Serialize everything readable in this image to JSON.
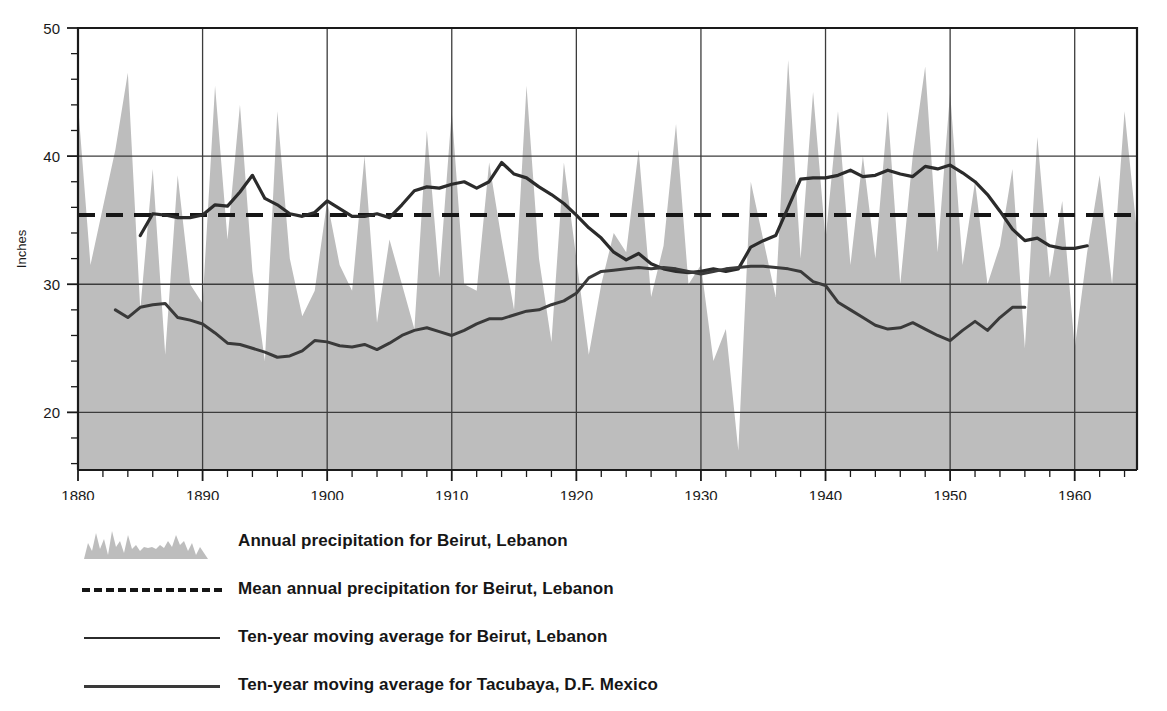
{
  "chart_data": {
    "type": "area",
    "title": "",
    "xlabel": "",
    "ylabel": "Inches",
    "xlim": [
      1880,
      1965
    ],
    "ylim": [
      15.5,
      50
    ],
    "xticks": [
      1880,
      1890,
      1900,
      1910,
      1920,
      1930,
      1940,
      1950,
      1960
    ],
    "xtick_labels": [
      "1880",
      "1890",
      "1900",
      "1910",
      "1920",
      "1930",
      "1940",
      "1950",
      "1960"
    ],
    "yticks": [
      20,
      30,
      40,
      50
    ],
    "ytick_labels": [
      "20",
      "30",
      "40",
      "50"
    ],
    "minor_tick_interval_x": 2,
    "minor_tick_interval_y": 2,
    "grid": "major gridlines at y=20,30,40 and x=1890,1900,1910,1920,1930,1940,1950,1960",
    "legend_position": "below plot, left aligned",
    "mean_value": 35.4,
    "series": [
      {
        "name": "Annual precipitation for Beirut, Lebanon",
        "render": "area",
        "color": "#bdbdbd",
        "x": [
          1880,
          1881,
          1882,
          1883,
          1884,
          1885,
          1886,
          1887,
          1888,
          1889,
          1890,
          1891,
          1892,
          1893,
          1894,
          1895,
          1896,
          1897,
          1898,
          1899,
          1900,
          1901,
          1902,
          1903,
          1904,
          1905,
          1906,
          1907,
          1908,
          1909,
          1910,
          1911,
          1912,
          1913,
          1914,
          1915,
          1916,
          1917,
          1918,
          1919,
          1920,
          1921,
          1922,
          1923,
          1924,
          1925,
          1926,
          1927,
          1928,
          1929,
          1930,
          1931,
          1932,
          1933,
          1934,
          1935,
          1936,
          1937,
          1938,
          1939,
          1940,
          1941,
          1942,
          1943,
          1944,
          1945,
          1946,
          1947,
          1948,
          1949,
          1950,
          1951,
          1952,
          1953,
          1954,
          1955,
          1956,
          1957,
          1958,
          1959,
          1960,
          1961,
          1962,
          1963,
          1964,
          1965
        ],
        "values": [
          44.0,
          31.5,
          36.0,
          40.5,
          46.5,
          28.0,
          39.0,
          24.5,
          38.5,
          30.0,
          28.5,
          45.5,
          33.5,
          44.0,
          31.0,
          24.0,
          43.5,
          32.0,
          27.5,
          29.5,
          36.5,
          31.5,
          29.5,
          40.0,
          27.0,
          33.5,
          30.0,
          26.5,
          42.0,
          30.5,
          43.5,
          30.0,
          29.5,
          39.5,
          33.5,
          28.0,
          45.5,
          32.0,
          25.5,
          39.5,
          32.0,
          24.5,
          30.0,
          34.0,
          32.5,
          40.5,
          29.0,
          33.0,
          42.5,
          30.0,
          31.5,
          24.0,
          26.5,
          17.0,
          38.0,
          33.5,
          29.0,
          47.5,
          32.0,
          45.0,
          33.5,
          43.5,
          31.5,
          40.0,
          32.0,
          43.5,
          30.0,
          40.0,
          47.0,
          32.5,
          45.0,
          31.5,
          38.0,
          30.0,
          33.0,
          39.0,
          25.0,
          41.5,
          30.5,
          36.5,
          25.0,
          32.5,
          38.5,
          30.0,
          43.5,
          34.0
        ]
      },
      {
        "name": "Mean annual precipitation for Beirut, Lebanon",
        "render": "dashed-horizontal-line",
        "color": "#161616",
        "value": 35.4
      },
      {
        "name": "Ten-year moving average for Beirut, Lebanon",
        "render": "line",
        "color": "#2b2b2b",
        "x": [
          1885,
          1886,
          1887,
          1888,
          1889,
          1890,
          1891,
          1892,
          1893,
          1894,
          1895,
          1896,
          1897,
          1898,
          1899,
          1900,
          1901,
          1902,
          1903,
          1904,
          1905,
          1906,
          1907,
          1908,
          1909,
          1910,
          1911,
          1912,
          1913,
          1914,
          1915,
          1916,
          1917,
          1918,
          1919,
          1920,
          1921,
          1922,
          1923,
          1924,
          1925,
          1926,
          1927,
          1928,
          1929,
          1930,
          1931,
          1932,
          1933,
          1934,
          1935,
          1936,
          1937,
          1938,
          1939,
          1940,
          1941,
          1942,
          1943,
          1944,
          1945,
          1946,
          1947,
          1948,
          1949,
          1950,
          1951,
          1952,
          1953,
          1954,
          1955,
          1956,
          1957,
          1958,
          1959,
          1960,
          1961
        ],
        "values": [
          33.8,
          35.5,
          35.4,
          35.2,
          35.2,
          35.4,
          36.2,
          36.1,
          37.2,
          38.5,
          36.7,
          36.2,
          35.5,
          35.3,
          35.6,
          36.5,
          35.9,
          35.3,
          35.3,
          35.5,
          35.2,
          36.2,
          37.3,
          37.6,
          37.5,
          37.8,
          38.0,
          37.5,
          38.0,
          39.5,
          38.6,
          38.3,
          37.6,
          37.0,
          36.3,
          35.4,
          34.4,
          33.6,
          32.5,
          31.9,
          32.4,
          31.6,
          31.2,
          31.0,
          30.9,
          31.0,
          31.2,
          31.0,
          31.2,
          32.9,
          33.4,
          33.8,
          36.0,
          38.2,
          38.3,
          38.3,
          38.5,
          38.9,
          38.4,
          38.5,
          38.9,
          38.6,
          38.4,
          39.2,
          39.0,
          39.3,
          38.7,
          38.0,
          37.0,
          35.7,
          34.3,
          33.4,
          33.6,
          33.0,
          32.8,
          32.8,
          33.0
        ]
      },
      {
        "name": "Ten-year moving average for Tacubaya, D.F. Mexico",
        "render": "line",
        "color": "#3a3a3a",
        "x": [
          1883,
          1884,
          1885,
          1886,
          1887,
          1888,
          1889,
          1890,
          1891,
          1892,
          1893,
          1894,
          1895,
          1896,
          1897,
          1898,
          1899,
          1900,
          1901,
          1902,
          1903,
          1904,
          1905,
          1906,
          1907,
          1908,
          1909,
          1910,
          1911,
          1912,
          1913,
          1914,
          1915,
          1916,
          1917,
          1918,
          1919,
          1920,
          1921,
          1922,
          1923,
          1924,
          1925,
          1926,
          1927,
          1928,
          1929,
          1930,
          1931,
          1932,
          1933,
          1934,
          1935,
          1936,
          1937,
          1938,
          1939,
          1940,
          1941,
          1942,
          1943,
          1944,
          1945,
          1946,
          1947,
          1948,
          1949,
          1950,
          1951,
          1952,
          1953,
          1954,
          1955,
          1956
        ],
        "values": [
          28.0,
          27.4,
          28.2,
          28.4,
          28.5,
          27.4,
          27.2,
          26.9,
          26.2,
          25.4,
          25.3,
          25.0,
          24.7,
          24.3,
          24.4,
          24.8,
          25.6,
          25.5,
          25.2,
          25.1,
          25.3,
          24.9,
          25.4,
          26.0,
          26.4,
          26.6,
          26.3,
          26.0,
          26.4,
          26.9,
          27.3,
          27.3,
          27.6,
          27.9,
          28.0,
          28.4,
          28.7,
          29.3,
          30.5,
          31.0,
          31.1,
          31.2,
          31.3,
          31.2,
          31.3,
          31.2,
          31.0,
          30.8,
          31.0,
          31.2,
          31.3,
          31.4,
          31.4,
          31.3,
          31.2,
          31.0,
          30.2,
          29.9,
          28.6,
          28.0,
          27.4,
          26.8,
          26.5,
          26.6,
          27.0,
          26.5,
          26.0,
          25.6,
          26.4,
          27.1,
          26.4,
          27.4,
          28.2,
          28.2
        ]
      }
    ]
  },
  "y_axis": {
    "title": "Inches"
  },
  "legend": {
    "items": [
      {
        "swatch": "area-silhouette",
        "label": "Annual precipitation for Beirut, Lebanon"
      },
      {
        "swatch": "dashed-line",
        "label": "Mean  annual  precipitation  for Beirut, Lebanon"
      },
      {
        "swatch": "solid-line-thick",
        "label": "Ten-year moving average  for Beirut, Lebanon"
      },
      {
        "swatch": "solid-line-med",
        "label": "Ten-year moving average  for Tacubaya, D.F. Mexico"
      }
    ]
  },
  "colors": {
    "area_fill": "#bdbdbd",
    "beirut_line": "#2b2b2b",
    "tacubaya_line": "#3a3a3a",
    "mean_line": "#161616",
    "axis": "#1a1a1a",
    "gridline": "#3c3c3c",
    "background": "#ffffff"
  }
}
